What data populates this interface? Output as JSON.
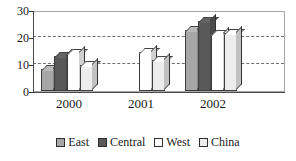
{
  "chart_data": {
    "type": "bar",
    "title": "",
    "subtitle": "",
    "xlabel": "",
    "ylabel": "",
    "categories": [
      "2000",
      "2001",
      "2002"
    ],
    "series": [
      {
        "name": "East",
        "color": "#a6a6a6",
        "values": [
          8,
          null,
          22.5
        ]
      },
      {
        "name": "Central",
        "color": "#595959",
        "values": [
          13,
          null,
          26
        ]
      },
      {
        "name": "West",
        "color": "#ffffff",
        "values": [
          14,
          14.5,
          21
        ]
      },
      {
        "name": "China",
        "color": "#ededed",
        "values": [
          9.5,
          11.5,
          21.5
        ]
      }
    ],
    "ylim": [
      0,
      30
    ],
    "yticks": [
      0,
      10,
      20,
      30
    ],
    "ytick_labels": [
      "0",
      "10",
      "20",
      "30"
    ],
    "grid": true,
    "grid_axis": "y",
    "legend_position": "bottom",
    "annotations": []
  },
  "legend": {
    "items": [
      {
        "label": "East"
      },
      {
        "label": "Central"
      },
      {
        "label": "West"
      },
      {
        "label": "China"
      }
    ]
  }
}
